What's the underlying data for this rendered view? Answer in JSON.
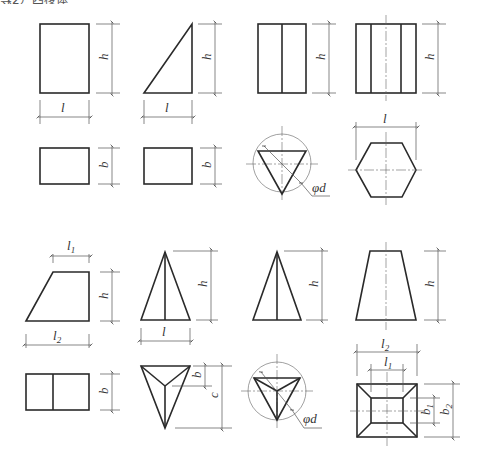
{
  "header": {
    "cropped_caption": "（2）四棱体等"
  },
  "labels": {
    "h": "h",
    "l": "l",
    "b": "b",
    "c": "c",
    "phi_d": "φd",
    "l1": "l",
    "l1_sub": "1",
    "l2": "l",
    "l2_sub": "2",
    "b1": "b",
    "b1_sub": "1",
    "b2": "b",
    "b2_sub": "2"
  },
  "figures": [
    {
      "id": "rect-front",
      "dims": [
        "h",
        "l"
      ]
    },
    {
      "id": "right-triangle-front",
      "dims": [
        "h",
        "l"
      ]
    },
    {
      "id": "two-panel-rect-front",
      "dims": [
        "h"
      ]
    },
    {
      "id": "three-panel-rect-front",
      "dims": [
        "h",
        "l"
      ]
    },
    {
      "id": "rect-top",
      "dims": [
        "b"
      ]
    },
    {
      "id": "rect-top-2",
      "dims": [
        "b"
      ]
    },
    {
      "id": "triangle-in-circle-top",
      "dims": [
        "φd"
      ]
    },
    {
      "id": "hexagon-top",
      "dims": [
        "l"
      ]
    },
    {
      "id": "trapezoid-front",
      "dims": [
        "l1",
        "h",
        "l2"
      ]
    },
    {
      "id": "split-triangle-front",
      "dims": [
        "h",
        "l"
      ]
    },
    {
      "id": "pyramid-side",
      "dims": [
        "h"
      ]
    },
    {
      "id": "isosceles-trapezoid-front",
      "dims": [
        "h"
      ]
    },
    {
      "id": "split-rect-top",
      "dims": [
        "b"
      ]
    },
    {
      "id": "inverted-triangle-top",
      "dims": [
        "b",
        "c"
      ]
    },
    {
      "id": "tri-pyramid-in-circle-top",
      "dims": [
        "φd"
      ]
    },
    {
      "id": "frustum-top",
      "dims": [
        "l2",
        "l1",
        "b1",
        "b2"
      ]
    }
  ]
}
